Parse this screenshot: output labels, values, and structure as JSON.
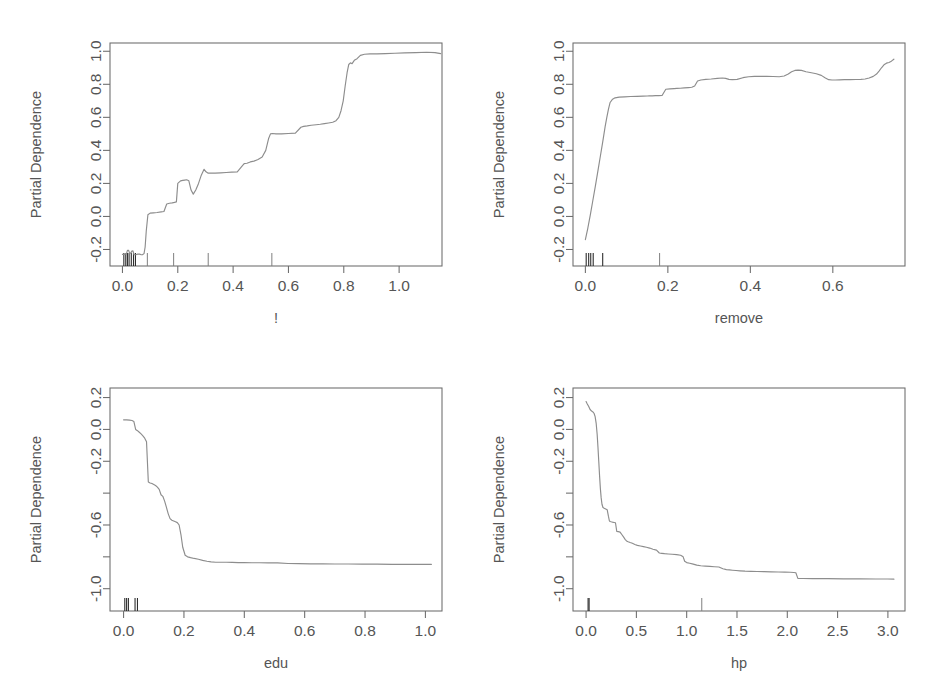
{
  "figure": {
    "background": "#ffffff",
    "curve_color": "#8d8d8d",
    "axis_color": "#6b6b6b",
    "text_color": "#555555",
    "rug_color": "#2e2e2e",
    "layout": "2x2 grid of partial dependence plots"
  },
  "chart_data": [
    {
      "type": "line",
      "title": "",
      "xlabel": "!",
      "ylabel": "Partial Dependence",
      "xlim": [
        -0.045,
        1.155
      ],
      "ylim": [
        -0.3,
        1.05
      ],
      "xticks": [
        0.0,
        0.2,
        0.4,
        0.6,
        0.8,
        1.0
      ],
      "xticklabels": [
        "0.0",
        "0.2",
        "0.4",
        "0.6",
        "0.8",
        "1.0"
      ],
      "yticks": [
        -0.2,
        0.0,
        0.2,
        0.4,
        0.6,
        0.8,
        1.0
      ],
      "yticklabels": [
        "-0.2",
        "0.0",
        "0.2",
        "0.4",
        "0.6",
        "0.8",
        "1.0"
      ],
      "grid": false,
      "legend": "none",
      "rug": [
        0.005,
        0.012,
        0.018,
        0.024,
        0.032,
        0.04,
        0.047,
        0.09,
        0.185,
        0.31,
        0.54
      ],
      "x": [
        0.0,
        0.008,
        0.01,
        0.014,
        0.018,
        0.022,
        0.026,
        0.03,
        0.034,
        0.038,
        0.042,
        0.048,
        0.055,
        0.062,
        0.068,
        0.072,
        0.078,
        0.082,
        0.086,
        0.092,
        0.1,
        0.112,
        0.125,
        0.14,
        0.15,
        0.16,
        0.17,
        0.18,
        0.188,
        0.195,
        0.2,
        0.21,
        0.218,
        0.225,
        0.232,
        0.24,
        0.248,
        0.256,
        0.265,
        0.275,
        0.285,
        0.295,
        0.302,
        0.31,
        0.32,
        0.335,
        0.355,
        0.375,
        0.395,
        0.415,
        0.43,
        0.44,
        0.45,
        0.462,
        0.475,
        0.49,
        0.505,
        0.518,
        0.528,
        0.535,
        0.542,
        0.555,
        0.575,
        0.6,
        0.625,
        0.645,
        0.655,
        0.668,
        0.682,
        0.7,
        0.715,
        0.73,
        0.745,
        0.76,
        0.772,
        0.782,
        0.79,
        0.798,
        0.805,
        0.812,
        0.818,
        0.824,
        0.83,
        0.838,
        0.848,
        0.86,
        0.875,
        0.895,
        0.92,
        0.95,
        0.985,
        1.02,
        1.06,
        1.1,
        1.13,
        1.15
      ],
      "y": [
        -0.23,
        -0.23,
        -0.225,
        -0.228,
        -0.205,
        -0.205,
        -0.222,
        -0.222,
        -0.21,
        -0.208,
        -0.232,
        -0.232,
        -0.228,
        -0.228,
        -0.232,
        -0.232,
        -0.225,
        -0.185,
        -0.09,
        0.01,
        0.02,
        0.022,
        0.024,
        0.028,
        0.03,
        0.075,
        0.08,
        0.082,
        0.085,
        0.088,
        0.2,
        0.215,
        0.218,
        0.22,
        0.222,
        0.216,
        0.16,
        0.135,
        0.16,
        0.2,
        0.25,
        0.285,
        0.27,
        0.262,
        0.262,
        0.262,
        0.264,
        0.266,
        0.268,
        0.27,
        0.3,
        0.32,
        0.322,
        0.33,
        0.335,
        0.345,
        0.36,
        0.4,
        0.47,
        0.5,
        0.502,
        0.5,
        0.5,
        0.502,
        0.504,
        0.54,
        0.545,
        0.548,
        0.552,
        0.555,
        0.558,
        0.562,
        0.566,
        0.57,
        0.58,
        0.6,
        0.64,
        0.7,
        0.79,
        0.87,
        0.92,
        0.93,
        0.925,
        0.945,
        0.955,
        0.975,
        0.982,
        0.984,
        0.984,
        0.986,
        0.988,
        0.99,
        0.992,
        0.994,
        0.992,
        0.986
      ]
    },
    {
      "type": "line",
      "title": "",
      "xlabel": "remove",
      "ylabel": "Partial Dependence",
      "xlim": [
        -0.03,
        0.775
      ],
      "ylim": [
        -0.3,
        1.05
      ],
      "xticks": [
        0.0,
        0.2,
        0.4,
        0.6
      ],
      "xticklabels": [
        "0.0",
        "0.2",
        "0.4",
        "0.6"
      ],
      "yticks": [
        -0.2,
        0.0,
        0.2,
        0.4,
        0.6,
        0.8,
        1.0
      ],
      "yticklabels": [
        "-0.2",
        "0.0",
        "0.2",
        "0.4",
        "0.6",
        "0.8",
        "1.0"
      ],
      "grid": false,
      "legend": "none",
      "rug": [
        0.002,
        0.008,
        0.013,
        0.019,
        0.042,
        0.18
      ],
      "x": [
        0.0,
        0.006,
        0.012,
        0.018,
        0.024,
        0.03,
        0.036,
        0.042,
        0.048,
        0.052,
        0.056,
        0.06,
        0.066,
        0.072,
        0.082,
        0.095,
        0.11,
        0.125,
        0.14,
        0.15,
        0.155,
        0.162,
        0.17,
        0.178,
        0.186,
        0.195,
        0.205,
        0.215,
        0.222,
        0.23,
        0.24,
        0.25,
        0.258,
        0.265,
        0.272,
        0.28,
        0.292,
        0.305,
        0.32,
        0.332,
        0.34,
        0.348,
        0.356,
        0.368,
        0.382,
        0.396,
        0.41,
        0.425,
        0.44,
        0.455,
        0.47,
        0.482,
        0.492,
        0.5,
        0.508,
        0.516,
        0.524,
        0.535,
        0.548,
        0.56,
        0.572,
        0.582,
        0.59,
        0.598,
        0.606,
        0.616,
        0.628,
        0.642,
        0.656,
        0.668,
        0.678,
        0.688,
        0.698,
        0.706,
        0.712,
        0.718,
        0.724,
        0.73,
        0.736,
        0.742,
        0.748
      ],
      "y": [
        -0.14,
        -0.07,
        0.01,
        0.095,
        0.18,
        0.27,
        0.36,
        0.45,
        0.545,
        0.6,
        0.65,
        0.69,
        0.71,
        0.718,
        0.722,
        0.724,
        0.726,
        0.727,
        0.728,
        0.729,
        0.73,
        0.73,
        0.731,
        0.731,
        0.732,
        0.77,
        0.772,
        0.774,
        0.775,
        0.776,
        0.778,
        0.78,
        0.782,
        0.79,
        0.82,
        0.826,
        0.83,
        0.832,
        0.836,
        0.838,
        0.836,
        0.83,
        0.828,
        0.83,
        0.84,
        0.846,
        0.848,
        0.848,
        0.848,
        0.847,
        0.846,
        0.85,
        0.862,
        0.876,
        0.884,
        0.886,
        0.884,
        0.876,
        0.87,
        0.864,
        0.854,
        0.838,
        0.828,
        0.826,
        0.826,
        0.827,
        0.828,
        0.828,
        0.829,
        0.83,
        0.832,
        0.838,
        0.848,
        0.862,
        0.88,
        0.9,
        0.918,
        0.928,
        0.932,
        0.94,
        0.952
      ]
    },
    {
      "type": "line",
      "title": "",
      "xlabel": "edu",
      "ylabel": "Partial Dependence",
      "xlim": [
        -0.045,
        1.055
      ],
      "ylim": [
        -1.14,
        0.26
      ],
      "xticks": [
        0.0,
        0.2,
        0.4,
        0.6,
        0.8,
        1.0
      ],
      "xticklabels": [
        "0.0",
        "0.2",
        "0.4",
        "0.6",
        "0.8",
        "1.0"
      ],
      "yticks": [
        0.2,
        0.0,
        -0.2,
        -0.4,
        -0.6,
        -0.8,
        -1.0
      ],
      "yticklabels": [
        "0.2",
        "0.0",
        "-0.2",
        "",
        "-0.6",
        "",
        "-1.0"
      ],
      "grid": false,
      "legend": "none",
      "rug": [
        0.004,
        0.01,
        0.016,
        0.038,
        0.046
      ],
      "x": [
        0.0,
        0.01,
        0.02,
        0.028,
        0.034,
        0.04,
        0.046,
        0.052,
        0.058,
        0.064,
        0.07,
        0.076,
        0.082,
        0.088,
        0.094,
        0.1,
        0.106,
        0.112,
        0.118,
        0.124,
        0.13,
        0.136,
        0.142,
        0.148,
        0.154,
        0.16,
        0.166,
        0.172,
        0.178,
        0.184,
        0.19,
        0.196,
        0.204,
        0.212,
        0.222,
        0.234,
        0.248,
        0.262,
        0.276,
        0.29,
        0.305,
        0.322,
        0.34,
        0.36,
        0.38,
        0.4,
        0.425,
        0.45,
        0.48,
        0.51,
        0.545,
        0.58,
        0.62,
        0.66,
        0.7,
        0.745,
        0.79,
        0.84,
        0.89,
        0.94,
        0.99,
        1.02
      ],
      "y": [
        0.06,
        0.06,
        0.058,
        0.056,
        0.05,
        0.0,
        -0.008,
        -0.018,
        -0.028,
        -0.04,
        -0.055,
        -0.078,
        -0.33,
        -0.336,
        -0.34,
        -0.346,
        -0.352,
        -0.362,
        -0.376,
        -0.41,
        -0.42,
        -0.45,
        -0.49,
        -0.53,
        -0.56,
        -0.57,
        -0.575,
        -0.58,
        -0.585,
        -0.6,
        -0.66,
        -0.74,
        -0.79,
        -0.8,
        -0.805,
        -0.81,
        -0.815,
        -0.822,
        -0.828,
        -0.832,
        -0.834,
        -0.834,
        -0.834,
        -0.835,
        -0.836,
        -0.836,
        -0.837,
        -0.837,
        -0.838,
        -0.838,
        -0.842,
        -0.843,
        -0.844,
        -0.844,
        -0.845,
        -0.845,
        -0.846,
        -0.846,
        -0.847,
        -0.847,
        -0.847,
        -0.847
      ]
    },
    {
      "type": "line",
      "title": "",
      "xlabel": "hp",
      "ylabel": "Partial Dependence",
      "xlim": [
        -0.13,
        3.17
      ],
      "ylim": [
        -1.14,
        0.26
      ],
      "xticks": [
        0.0,
        0.5,
        1.0,
        1.5,
        2.0,
        2.5,
        3.0
      ],
      "xticklabels": [
        "0.0",
        "0.5",
        "1.0",
        "1.5",
        "2.0",
        "2.5",
        "3.0"
      ],
      "yticks": [
        0.2,
        0.0,
        -0.2,
        -0.4,
        -0.6,
        -0.8,
        -1.0
      ],
      "yticklabels": [
        "0.2",
        "0.0",
        "-0.2",
        "",
        "-0.6",
        "",
        "-1.0"
      ],
      "grid": false,
      "legend": "none",
      "rug": [
        0.02,
        0.03,
        1.15
      ],
      "x": [
        0.0,
        0.012,
        0.025,
        0.04,
        0.055,
        0.068,
        0.08,
        0.09,
        0.1,
        0.11,
        0.118,
        0.126,
        0.134,
        0.142,
        0.15,
        0.158,
        0.168,
        0.18,
        0.195,
        0.21,
        0.222,
        0.232,
        0.24,
        0.25,
        0.262,
        0.278,
        0.292,
        0.305,
        0.32,
        0.338,
        0.355,
        0.372,
        0.388,
        0.402,
        0.418,
        0.438,
        0.46,
        0.485,
        0.51,
        0.54,
        0.57,
        0.6,
        0.632,
        0.665,
        0.7,
        0.728,
        0.752,
        0.78,
        0.815,
        0.855,
        0.9,
        0.94,
        0.965,
        0.98,
        1.0,
        1.03,
        1.065,
        1.1,
        1.14,
        1.185,
        1.23,
        1.275,
        1.32,
        1.36,
        1.395,
        1.425,
        1.455,
        1.49,
        1.53,
        1.58,
        1.64,
        1.7,
        1.77,
        1.84,
        1.91,
        1.975,
        2.03,
        2.065,
        2.085,
        2.105,
        2.16,
        2.25,
        2.4,
        2.56,
        2.72,
        2.88,
        3.0,
        3.06
      ],
      "y": [
        0.175,
        0.16,
        0.145,
        0.125,
        0.115,
        0.11,
        0.1,
        0.08,
        0.04,
        -0.03,
        -0.11,
        -0.2,
        -0.29,
        -0.37,
        -0.43,
        -0.47,
        -0.49,
        -0.495,
        -0.5,
        -0.505,
        -0.545,
        -0.575,
        -0.578,
        -0.58,
        -0.582,
        -0.584,
        -0.586,
        -0.64,
        -0.642,
        -0.645,
        -0.66,
        -0.675,
        -0.69,
        -0.7,
        -0.705,
        -0.71,
        -0.715,
        -0.722,
        -0.728,
        -0.732,
        -0.736,
        -0.74,
        -0.745,
        -0.752,
        -0.758,
        -0.776,
        -0.778,
        -0.78,
        -0.782,
        -0.784,
        -0.786,
        -0.79,
        -0.8,
        -0.828,
        -0.836,
        -0.84,
        -0.846,
        -0.852,
        -0.856,
        -0.858,
        -0.86,
        -0.862,
        -0.864,
        -0.875,
        -0.88,
        -0.882,
        -0.884,
        -0.886,
        -0.888,
        -0.89,
        -0.891,
        -0.892,
        -0.893,
        -0.894,
        -0.895,
        -0.896,
        -0.897,
        -0.898,
        -0.9,
        -0.935,
        -0.936,
        -0.937,
        -0.937,
        -0.938,
        -0.938,
        -0.939,
        -0.939,
        -0.94
      ]
    }
  ]
}
